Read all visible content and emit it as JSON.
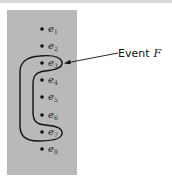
{
  "diagram": {
    "type": "sample-space-event",
    "sample_points": [
      {
        "symbol": "e",
        "subscript": "1"
      },
      {
        "symbol": "e",
        "subscript": "2"
      },
      {
        "symbol": "e",
        "subscript": "3"
      },
      {
        "symbol": "e",
        "subscript": "4"
      },
      {
        "symbol": "e",
        "subscript": "5"
      },
      {
        "symbol": "e",
        "subscript": "6"
      },
      {
        "symbol": "e",
        "subscript": "7"
      },
      {
        "symbol": "e",
        "subscript": "8"
      }
    ],
    "event": {
      "label": "Event",
      "name": "F",
      "members": [
        "e3",
        "e4",
        "e5",
        "e6",
        "e7"
      ]
    },
    "colors": {
      "panel": "#b9b9b9",
      "ink": "#111111"
    }
  }
}
